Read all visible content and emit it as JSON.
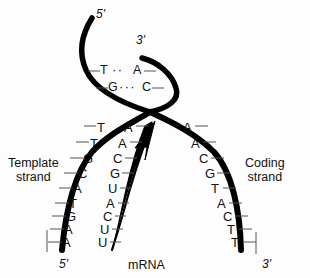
{
  "figure": {
    "background_color": "#fdfdfd",
    "ink_color": "#000000"
  },
  "labels": {
    "template_strand_line1": "Template",
    "template_strand_line2": "strand",
    "coding_strand_line1": "Coding",
    "coding_strand_line2": "strand",
    "mrna": "mRNA",
    "top_left_end": "5'",
    "top_right_end": "3'",
    "bottom_left_end": "5'",
    "bottom_right_end": "3'"
  },
  "helix_pairs": [
    {
      "left_base": "T",
      "bond": "··",
      "right_base": "A"
    },
    {
      "left_base": "G",
      "bond": "···",
      "right_base": "C"
    }
  ],
  "template_strand_bases": [
    "T",
    "T",
    "G",
    "C",
    "A",
    "T",
    "G",
    "A",
    "A"
  ],
  "mrna_bases": [
    "A",
    "A",
    "C",
    "G",
    "U",
    "A",
    "C",
    "U",
    "U"
  ],
  "coding_strand_bases": [
    "A",
    "A",
    "C",
    "G",
    "T",
    "A",
    "C",
    "T",
    "T"
  ],
  "base_positions": {
    "template": [
      {
        "x": 100,
        "y": 130
      },
      {
        "x": 93,
        "y": 146
      },
      {
        "x": 87,
        "y": 162
      },
      {
        "x": 82,
        "y": 177
      },
      {
        "x": 77,
        "y": 192
      },
      {
        "x": 73,
        "y": 207
      },
      {
        "x": 70,
        "y": 220
      },
      {
        "x": 68,
        "y": 233
      },
      {
        "x": 66,
        "y": 246
      }
    ],
    "mrna": [
      {
        "x": 126,
        "y": 130
      },
      {
        "x": 120,
        "y": 146
      },
      {
        "x": 114,
        "y": 162
      },
      {
        "x": 112,
        "y": 177
      },
      {
        "x": 110,
        "y": 192
      },
      {
        "x": 108,
        "y": 207
      },
      {
        "x": 105,
        "y": 220
      },
      {
        "x": 102,
        "y": 233
      },
      {
        "x": 100,
        "y": 246
      }
    ],
    "coding": [
      {
        "x": 185,
        "y": 130
      },
      {
        "x": 193,
        "y": 146
      },
      {
        "x": 201,
        "y": 162
      },
      {
        "x": 207,
        "y": 177
      },
      {
        "x": 213,
        "y": 192
      },
      {
        "x": 219,
        "y": 207
      },
      {
        "x": 225,
        "y": 220
      },
      {
        "x": 229,
        "y": 233
      },
      {
        "x": 233,
        "y": 246
      }
    ]
  }
}
